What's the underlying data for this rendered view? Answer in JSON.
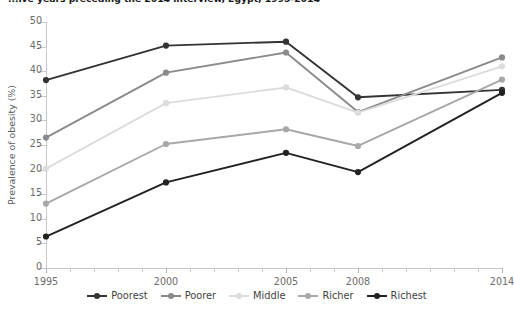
{
  "chart_data": {
    "type": "line",
    "title": "...ive years preceding the 2014 interview, Egypt, 1995-2014",
    "xlabel": "",
    "ylabel": "Prevalence of obesity (%)",
    "x": [
      1995,
      2000,
      2005,
      2008,
      2014
    ],
    "xtick_labels": [
      "1995",
      "2000",
      "2005",
      "2008",
      "2014"
    ],
    "ytick_labels": [
      "0",
      "5",
      "10",
      "15",
      "20",
      "25",
      "30",
      "35",
      "40",
      "45",
      "50"
    ],
    "xlim": [
      1995,
      2014
    ],
    "ylim": [
      0,
      50
    ],
    "ystep": 5,
    "grid": false,
    "legend_position": "bottom",
    "series": [
      {
        "name": "Poorest",
        "color": "#333333",
        "values": [
          38.2,
          45.2,
          46.0,
          34.7,
          36.2
        ]
      },
      {
        "name": "Poorer",
        "color": "#8a8a8a",
        "values": [
          26.5,
          39.7,
          43.8,
          31.7,
          42.8
        ]
      },
      {
        "name": "Middle",
        "color": "#dcdcdc",
        "values": [
          20.2,
          33.5,
          36.7,
          31.6,
          41.0
        ]
      },
      {
        "name": "Richer",
        "color": "#a8a8a8",
        "values": [
          13.1,
          25.2,
          28.2,
          24.8,
          38.3
        ]
      },
      {
        "name": "Richest",
        "color": "#222222",
        "values": [
          6.4,
          17.4,
          23.4,
          19.5,
          35.6
        ]
      }
    ]
  }
}
